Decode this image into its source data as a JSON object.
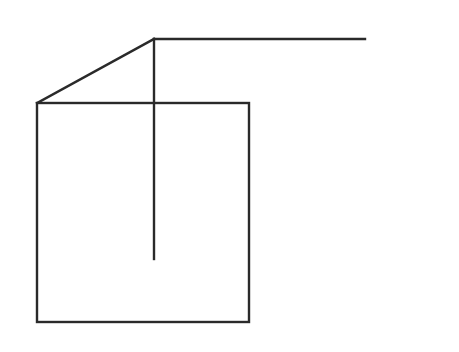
{
  "diagram": {
    "background": "#ffffff",
    "stroke": "#2a2a2a",
    "stroke_width": 2.4,
    "square": {
      "x1": 37,
      "y1": 103,
      "x2": 249,
      "y2": 322
    },
    "diagonal": {
      "x1": 37,
      "y1": 103,
      "x2": 154,
      "y2": 39
    },
    "top_line": {
      "x1": 154,
      "y1": 39,
      "x2": 365,
      "y2": 39
    },
    "vertical_line": {
      "x1": 154,
      "y1": 39,
      "x2": 154,
      "y2": 259
    }
  }
}
